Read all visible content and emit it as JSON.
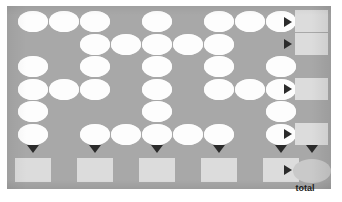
{
  "worksheet": {
    "kind": "number-grid-sum-puzzle",
    "panel_color": "#a8a8a8",
    "page_color": "#ffffff",
    "cell_color": "#fdfdfd",
    "sum_box_color": "#dcdcdc",
    "total_oval_color": "#c9c9c9",
    "arrow_color": "#2b2b2b",
    "columns": 9,
    "rows": 6,
    "total_label": "total",
    "grid": {
      "comment": "Each row lists which of the 9 columns contain a blank white oval cell (1-indexed).",
      "rows": [
        {
          "id": "row-1",
          "filled_columns": [
            1,
            2,
            3,
            5,
            7,
            8,
            9
          ],
          "has_row_sum": true
        },
        {
          "id": "row-2",
          "filled_columns": [
            3,
            4,
            5,
            6,
            7
          ],
          "has_row_sum": true
        },
        {
          "id": "row-3",
          "filled_columns": [
            1,
            3,
            5,
            7,
            9
          ],
          "has_row_sum": false
        },
        {
          "id": "row-4",
          "filled_columns": [
            1,
            2,
            3,
            5,
            7,
            8,
            9
          ],
          "has_row_sum": true
        },
        {
          "id": "row-5",
          "filled_columns": [
            1,
            5,
            9
          ],
          "has_row_sum": false
        },
        {
          "id": "row-6",
          "filled_columns": [
            1,
            3,
            4,
            5,
            6,
            7,
            9
          ],
          "has_row_sum": true
        }
      ]
    },
    "row_sums": [
      {
        "id": "row-sum-1",
        "row": 1,
        "value": ""
      },
      {
        "id": "row-sum-2",
        "row": 2,
        "value": ""
      },
      {
        "id": "row-sum-4",
        "row": 4,
        "value": ""
      },
      {
        "id": "row-sum-6",
        "row": 6,
        "value": ""
      }
    ],
    "column_sums": [
      {
        "id": "col-sum-1",
        "column": 1,
        "value": ""
      },
      {
        "id": "col-sum-3",
        "column": 3,
        "value": ""
      },
      {
        "id": "col-sum-5",
        "column": 5,
        "value": ""
      },
      {
        "id": "col-sum-7",
        "column": 7,
        "value": ""
      },
      {
        "id": "col-sum-9",
        "column": 9,
        "value": ""
      }
    ],
    "total": {
      "id": "grand-total",
      "value": ""
    }
  }
}
